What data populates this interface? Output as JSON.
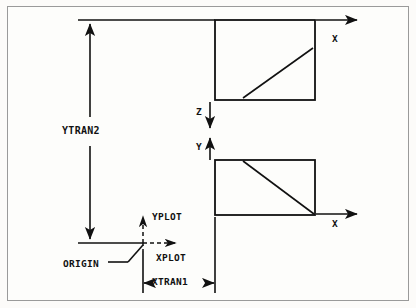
{
  "figure": {
    "background_color": "#fcfbf9",
    "frame_color": "#9a9a9a",
    "line_color": "#111111"
  },
  "labels": {
    "ytran2": "YTRAN2",
    "xtran1": "XTRAN1",
    "origin": "ORIGIN",
    "xplot": "XPLOT",
    "yplot": "YPLOT",
    "z_axis": "Z",
    "y_axis": "Y",
    "x_axis_top": "X",
    "x_axis_bottom": "X"
  },
  "diagram_elements": {
    "rectangles": [
      {
        "name": "top-view-box",
        "x": 215,
        "y": 20,
        "width": 100,
        "height": 80,
        "diagonal": "bottom-left-to-top-right"
      },
      {
        "name": "bottom-view-box",
        "x": 215,
        "y": 160,
        "width": 100,
        "height": 55,
        "diagonal": "top-left-to-bottom-right"
      }
    ],
    "axes": [
      {
        "name": "x-axis-top",
        "direction": "right",
        "label": "X"
      },
      {
        "name": "x-axis-bottom",
        "direction": "right",
        "label": "X"
      },
      {
        "name": "z-axis",
        "direction": "down",
        "label": "Z"
      },
      {
        "name": "y-axis",
        "direction": "up",
        "label": "Y"
      },
      {
        "name": "xplot-axis",
        "direction": "right",
        "label": "XPLOT",
        "style": "dashed"
      },
      {
        "name": "yplot-axis",
        "direction": "up",
        "label": "YPLOT",
        "style": "dashed"
      }
    ],
    "dimensions": [
      {
        "name": "ytran2-dimension",
        "label": "YTRAN2",
        "orientation": "vertical",
        "arrows": "both"
      },
      {
        "name": "xtran1-dimension",
        "label": "XTRAN1",
        "orientation": "horizontal",
        "arrows": "both"
      }
    ],
    "origin_point": {
      "name": "origin-marker",
      "label": "ORIGIN",
      "x": 143,
      "y": 243
    }
  }
}
